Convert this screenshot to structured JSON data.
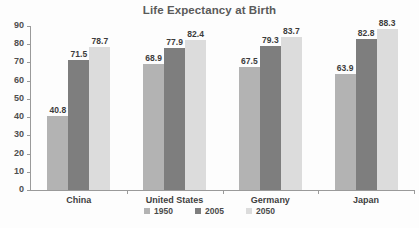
{
  "chart_data": {
    "type": "bar",
    "title": "Life Expectancy at Birth",
    "xlabel": "",
    "ylabel": "",
    "ylim": [
      0,
      90
    ],
    "ytick_step": 10,
    "yticks": [
      90,
      80,
      70,
      60,
      50,
      40,
      30,
      20,
      10,
      0
    ],
    "grid": false,
    "legend_position": "bottom",
    "categories": [
      "China",
      "United States",
      "Germany",
      "Japan"
    ],
    "series": [
      {
        "name": "1950",
        "color": "#b3b3b3",
        "values": [
          40.8,
          68.9,
          67.5,
          63.9
        ]
      },
      {
        "name": "2005",
        "color": "#7e7e7e",
        "values": [
          71.5,
          77.9,
          79.3,
          82.8
        ]
      },
      {
        "name": "2050",
        "color": "#dcdcdc",
        "values": [
          78.7,
          82.4,
          83.7,
          88.3
        ]
      }
    ]
  },
  "colors": {
    "title": "#5a5a5a",
    "axis": "#9a9a9a",
    "label": "#3c3c3c",
    "background": "#fdfdfd"
  }
}
